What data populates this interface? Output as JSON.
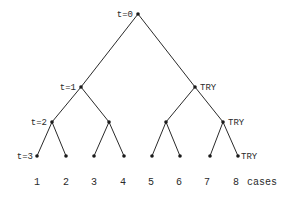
{
  "diagram": {
    "type": "binary-tree",
    "levels": [
      {
        "label": "t=0"
      },
      {
        "label": "t=1"
      },
      {
        "label": "t=2"
      },
      {
        "label": "t=3"
      }
    ],
    "try_label": "TRY",
    "cases_label": "cases",
    "cases": [
      "1",
      "2",
      "3",
      "4",
      "5",
      "6",
      "7",
      "8"
    ],
    "nodes": [
      {
        "id": "root",
        "x": 138,
        "y": 14
      },
      {
        "id": "l1a",
        "x": 81,
        "y": 87
      },
      {
        "id": "l1b",
        "x": 195,
        "y": 87,
        "try": true
      },
      {
        "id": "l2a",
        "x": 52,
        "y": 122
      },
      {
        "id": "l2b",
        "x": 109,
        "y": 122
      },
      {
        "id": "l2c",
        "x": 166,
        "y": 122
      },
      {
        "id": "l2d",
        "x": 223,
        "y": 122,
        "try": true
      },
      {
        "id": "leaf1",
        "x": 37,
        "y": 156
      },
      {
        "id": "leaf2",
        "x": 66,
        "y": 156
      },
      {
        "id": "leaf3",
        "x": 94,
        "y": 156
      },
      {
        "id": "leaf4",
        "x": 124,
        "y": 156
      },
      {
        "id": "leaf5",
        "x": 152,
        "y": 156
      },
      {
        "id": "leaf6",
        "x": 180,
        "y": 156
      },
      {
        "id": "leaf7",
        "x": 210,
        "y": 156
      },
      {
        "id": "leaf8",
        "x": 238,
        "y": 156,
        "try": true
      }
    ]
  }
}
